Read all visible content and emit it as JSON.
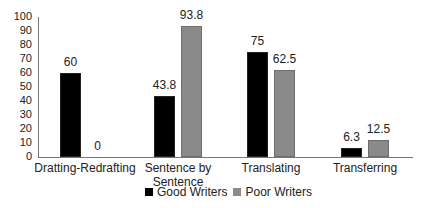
{
  "chart_data": {
    "type": "bar",
    "title": "",
    "xlabel": "",
    "ylabel": "",
    "ylim": [
      0,
      100
    ],
    "yticks": [
      0,
      10,
      20,
      30,
      40,
      50,
      60,
      70,
      80,
      90,
      100
    ],
    "grid": false,
    "legend_position": "bottom",
    "categories": [
      "Dratting-Redrafting",
      "Sentence by Sentence",
      "Translating",
      "Transferring"
    ],
    "series": [
      {
        "name": "Good Writers",
        "color": "#000000",
        "values": [
          60,
          43.8,
          75,
          6.3
        ]
      },
      {
        "name": "Poor Writers",
        "color": "#8a8a8a",
        "values": [
          0,
          93.8,
          62.5,
          12.5
        ]
      }
    ],
    "value_labels": [
      [
        "60",
        "43.8",
        "75",
        "6.3"
      ],
      [
        "0",
        "93.8",
        "62.5",
        "12.5"
      ]
    ]
  }
}
